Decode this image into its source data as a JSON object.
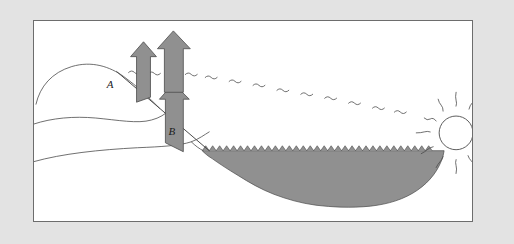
{
  "figure": {
    "title": "Solar radiation and water heating diagram",
    "panel_background": "#ffffff",
    "outer_background": "#e3e3e3",
    "border_color": "#6d6d6d"
  },
  "colors": {
    "arrow_fill": "#909090",
    "arrow_stroke": "#4a4a4a",
    "water_fill": "#909090",
    "water_stroke": "#4a4a4a",
    "line_stroke": "#4a4a4a",
    "sun_fill": "#ffffff",
    "sun_stroke": "#4a4a4a",
    "label_color": "#1b1b1b"
  },
  "labels": {
    "point_a": "A",
    "point_b": "B"
  },
  "elements": {
    "sun_name": "sun",
    "sun_ray_count": 12,
    "water_name": "water-body",
    "water_surface_name": "water-surface-waves",
    "hill_name": "hill-terrain",
    "slope_name": "hill-slope-line",
    "arrow_a_name": "upward-arrow-a",
    "arrow_b_name": "upward-arrow-b",
    "arrow_b_secondary_name": "upward-arrow-b-upper",
    "incoming_ray_name": "incoming-solar-ray"
  },
  "geometry": {
    "panel": {
      "x": 33,
      "y": 20,
      "width": 440,
      "height": 202
    },
    "sun": {
      "cx": 425,
      "cy": 118,
      "r": 17
    },
    "water_surface_y": 150,
    "water_left_x": 202,
    "water_right_x": 445,
    "arrow_a": {
      "x": 112,
      "y_top": 40,
      "y_bottom": 95,
      "width": 14
    },
    "arrow_b": {
      "x": 163,
      "y_top": 33,
      "y_bottom": 140,
      "width": 18
    },
    "label_a": {
      "x": 108,
      "y": 87
    },
    "label_b": {
      "x": 170,
      "y": 133
    }
  }
}
